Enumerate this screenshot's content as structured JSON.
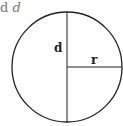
{
  "caption": {
    "text_upright": "d",
    "text_italic": "d"
  },
  "diagram": {
    "shape": "circle",
    "labels": {
      "diameter": "d",
      "radius": "r"
    },
    "colors": {
      "stroke": "#222222",
      "background": "#ffffff"
    }
  }
}
